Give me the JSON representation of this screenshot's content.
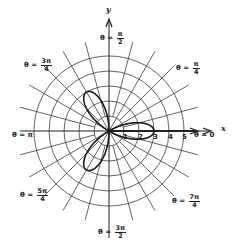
{
  "chart_data": {
    "type": "polar",
    "title": "",
    "equation_plotted": "r = 3cos(3θ)",
    "curve": {
      "kind": "rose",
      "petals": 3,
      "amplitude": 3,
      "petal_angles_rad": [
        "0",
        "2π/3",
        "4π/3"
      ]
    },
    "grid": {
      "rings": [
        1,
        2,
        3,
        4,
        5
      ],
      "spoke_step_degrees": 15,
      "center_px": [
        109,
        131
      ],
      "ring_spacing_px": 15
    },
    "axes": {
      "x_label": "x",
      "y_label": "y",
      "radial_tick_labels": [
        "1",
        "2",
        "3",
        "4",
        "5"
      ]
    },
    "angle_labels": [
      {
        "id": "theta-0",
        "prefix": "θ = ",
        "value": "0"
      },
      {
        "id": "theta-pi-4",
        "prefix": "θ = ",
        "num": "π",
        "den": "4"
      },
      {
        "id": "theta-pi-2",
        "prefix": "θ = ",
        "num": "π",
        "den": "2"
      },
      {
        "id": "theta-3pi-4",
        "prefix": "θ = ",
        "num": "3π",
        "den": "4"
      },
      {
        "id": "theta-pi",
        "prefix": "θ = ",
        "value": "π"
      },
      {
        "id": "theta-5pi-4",
        "prefix": "θ = ",
        "num": "5π",
        "den": "4"
      },
      {
        "id": "theta-3pi-2",
        "prefix": "θ = ",
        "num": "3π",
        "den": "2"
      },
      {
        "id": "theta-7pi-4",
        "prefix": "θ = ",
        "num": "7π",
        "den": "4"
      }
    ]
  },
  "colors": {
    "grid": "#3a3a3a",
    "curve": "#1a1a1a",
    "text": "#222222",
    "background": "#ffffff"
  }
}
